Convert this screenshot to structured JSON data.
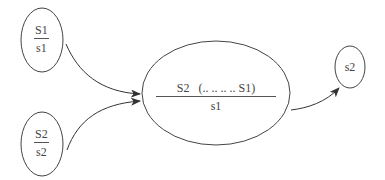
{
  "diagram": {
    "type": "flow",
    "colors": {
      "stroke": "#444444",
      "text": "#444444",
      "background": "#ffffff"
    },
    "nodes": [
      {
        "id": "node-s1",
        "numerator": "S1",
        "denominator": "s1"
      },
      {
        "id": "node-s2",
        "numerator": "S2",
        "denominator": "s2"
      },
      {
        "id": "node-combined",
        "numerator": "S2   (.. .. .. .. S1)",
        "denominator": "s1"
      },
      {
        "id": "node-result",
        "label": "s2"
      }
    ],
    "edges": [
      {
        "from": "node-s1",
        "to": "node-combined"
      },
      {
        "from": "node-s2",
        "to": "node-combined"
      },
      {
        "from": "node-combined",
        "to": "node-result"
      }
    ]
  }
}
